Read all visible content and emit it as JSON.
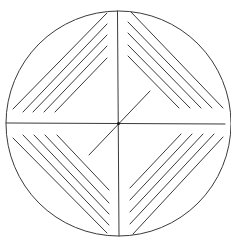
{
  "canvas": {
    "width": 231,
    "height": 247,
    "background": "#ffffff"
  },
  "stroke": {
    "color": "#3a3a3a",
    "width": 1
  },
  "circle": {
    "cx": 118.5,
    "cy": 123.5,
    "r": 112.5
  },
  "axes": {
    "horizontal": {
      "x1": 6,
      "y1": 123,
      "x2": 225,
      "y2": 124
    },
    "vertical": {
      "x1": 117.5,
      "y1": 11,
      "x2": 119,
      "y2": 236
    }
  },
  "center_dot": {
    "cx": 118.5,
    "cy": 123.5,
    "r": 1.6,
    "color": "#1a1a1a"
  },
  "diagonal": {
    "x1": 89,
    "y1": 155,
    "x2": 150,
    "y2": 91
  },
  "hatching": {
    "top_left": [
      {
        "x1": 13,
        "y1": 109,
        "x2": 107,
        "y2": 13
      },
      {
        "x1": 23,
        "y1": 112,
        "x2": 107,
        "y2": 24
      },
      {
        "x1": 33,
        "y1": 112,
        "x2": 107,
        "y2": 35
      },
      {
        "x1": 44,
        "y1": 112,
        "x2": 107,
        "y2": 46
      },
      {
        "x1": 55,
        "y1": 112,
        "x2": 107,
        "y2": 58
      }
    ],
    "top_right": [
      {
        "x1": 131,
        "y1": 12,
        "x2": 223,
        "y2": 108
      },
      {
        "x1": 128,
        "y1": 22,
        "x2": 212,
        "y2": 108
      },
      {
        "x1": 128,
        "y1": 33,
        "x2": 201,
        "y2": 108
      },
      {
        "x1": 128,
        "y1": 45,
        "x2": 190,
        "y2": 108
      },
      {
        "x1": 128,
        "y1": 56,
        "x2": 179,
        "y2": 108
      }
    ],
    "bottom_left": [
      {
        "x1": 13,
        "y1": 138,
        "x2": 107,
        "y2": 233
      },
      {
        "x1": 23,
        "y1": 135,
        "x2": 109,
        "y2": 225
      },
      {
        "x1": 34,
        "y1": 135,
        "x2": 109,
        "y2": 214
      },
      {
        "x1": 45,
        "y1": 135,
        "x2": 109,
        "y2": 203
      },
      {
        "x1": 57,
        "y1": 135,
        "x2": 109,
        "y2": 190
      }
    ],
    "bottom_right": [
      {
        "x1": 133,
        "y1": 234,
        "x2": 223,
        "y2": 137
      },
      {
        "x1": 130,
        "y1": 224,
        "x2": 214,
        "y2": 134
      },
      {
        "x1": 130,
        "y1": 212,
        "x2": 203,
        "y2": 134
      },
      {
        "x1": 130,
        "y1": 200,
        "x2": 192,
        "y2": 134
      },
      {
        "x1": 130,
        "y1": 188,
        "x2": 181,
        "y2": 134
      }
    ]
  }
}
